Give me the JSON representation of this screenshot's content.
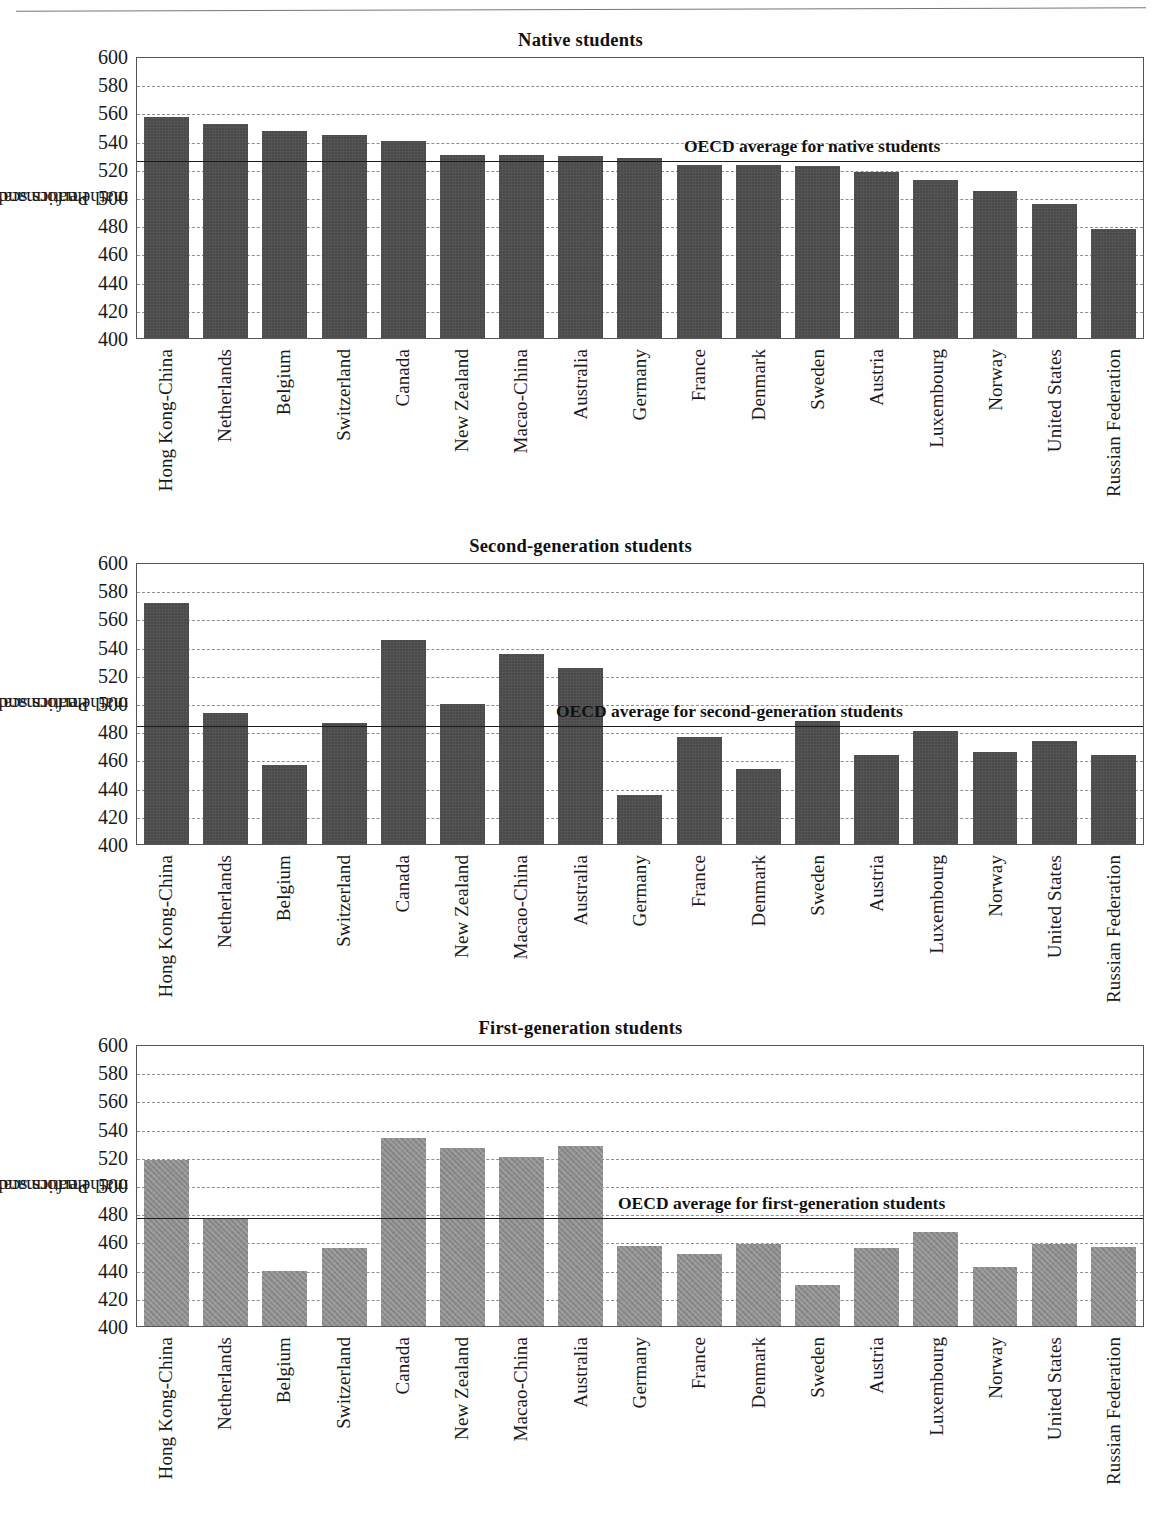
{
  "page": {
    "has_top_rule": true,
    "y_axis_title_line1": "Performance on the",
    "y_axis_title_line2": "mathematics scale"
  },
  "colors": {
    "bar_dark": "#4a4a4a",
    "bar_light": "#8b8b8b",
    "gridline": "#8d8d8d",
    "average_line": "#1c1c1c",
    "plot_border": "#555555"
  },
  "categories": [
    "Hong Kong-China",
    "Netherlands",
    "Belgium",
    "Switzerland",
    "Canada",
    "New Zealand",
    "Macao-China",
    "Australia",
    "Germany",
    "France",
    "Denmark",
    "Sweden",
    "Austria",
    "Luxembourg",
    "Norway",
    "United States",
    "Russian Federation"
  ],
  "ticks": [
    400,
    420,
    440,
    460,
    480,
    500,
    520,
    540,
    560,
    580,
    600
  ],
  "chart_data": [
    {
      "type": "bar",
      "title": "Native students",
      "xlabel": "",
      "ylabel": "Performance on the mathematics scale",
      "ylim": [
        400,
        600
      ],
      "ytick_step": 20,
      "grid": true,
      "legend": "none",
      "bar_style": "dark",
      "categories": [
        "Hong Kong-China",
        "Netherlands",
        "Belgium",
        "Switzerland",
        "Canada",
        "New Zealand",
        "Macao-China",
        "Australia",
        "Germany",
        "France",
        "Denmark",
        "Sweden",
        "Austria",
        "Luxembourg",
        "Norway",
        "United States",
        "Russian Federation"
      ],
      "values": [
        557,
        552,
        547,
        544,
        540,
        530,
        530,
        529,
        528,
        523,
        523,
        522,
        518,
        512,
        504,
        495,
        477
      ],
      "annotations": [
        {
          "type": "hline",
          "label": "OECD average for native students",
          "value": 527
        }
      ]
    },
    {
      "type": "bar",
      "title": "Second-generation students",
      "xlabel": "",
      "ylabel": "Performance on the mathematics scale",
      "ylim": [
        400,
        600
      ],
      "ytick_step": 20,
      "grid": true,
      "legend": "none",
      "bar_style": "dark",
      "categories": [
        "Hong Kong-China",
        "Netherlands",
        "Belgium",
        "Switzerland",
        "Canada",
        "New Zealand",
        "Macao-China",
        "Australia",
        "Germany",
        "France",
        "Denmark",
        "Sweden",
        "Austria",
        "Luxembourg",
        "Norway",
        "United States",
        "Russian Federation"
      ],
      "values": [
        571,
        493,
        456,
        486,
        545,
        499,
        535,
        525,
        435,
        476,
        453,
        487,
        463,
        480,
        465,
        473,
        463
      ],
      "annotations": [
        {
          "type": "hline",
          "label": "OECD average for second-generation students",
          "value": 485
        }
      ]
    },
    {
      "type": "bar",
      "title": "First-generation students",
      "xlabel": "",
      "ylabel": "Performance on the mathematics scale",
      "ylim": [
        400,
        600
      ],
      "ytick_step": 20,
      "grid": true,
      "legend": "none",
      "bar_style": "light",
      "categories": [
        "Hong Kong-China",
        "Netherlands",
        "Belgium",
        "Switzerland",
        "Canada",
        "New Zealand",
        "Macao-China",
        "Australia",
        "Germany",
        "France",
        "Denmark",
        "Sweden",
        "Austria",
        "Luxembourg",
        "Norway",
        "United States",
        "Russian Federation"
      ],
      "values": [
        518,
        476,
        439,
        455,
        533,
        526,
        520,
        528,
        457,
        451,
        458,
        429,
        455,
        467,
        442,
        458,
        456
      ],
      "annotations": [
        {
          "type": "hline",
          "label": "OECD average for first-generation students",
          "value": 478
        }
      ]
    }
  ]
}
